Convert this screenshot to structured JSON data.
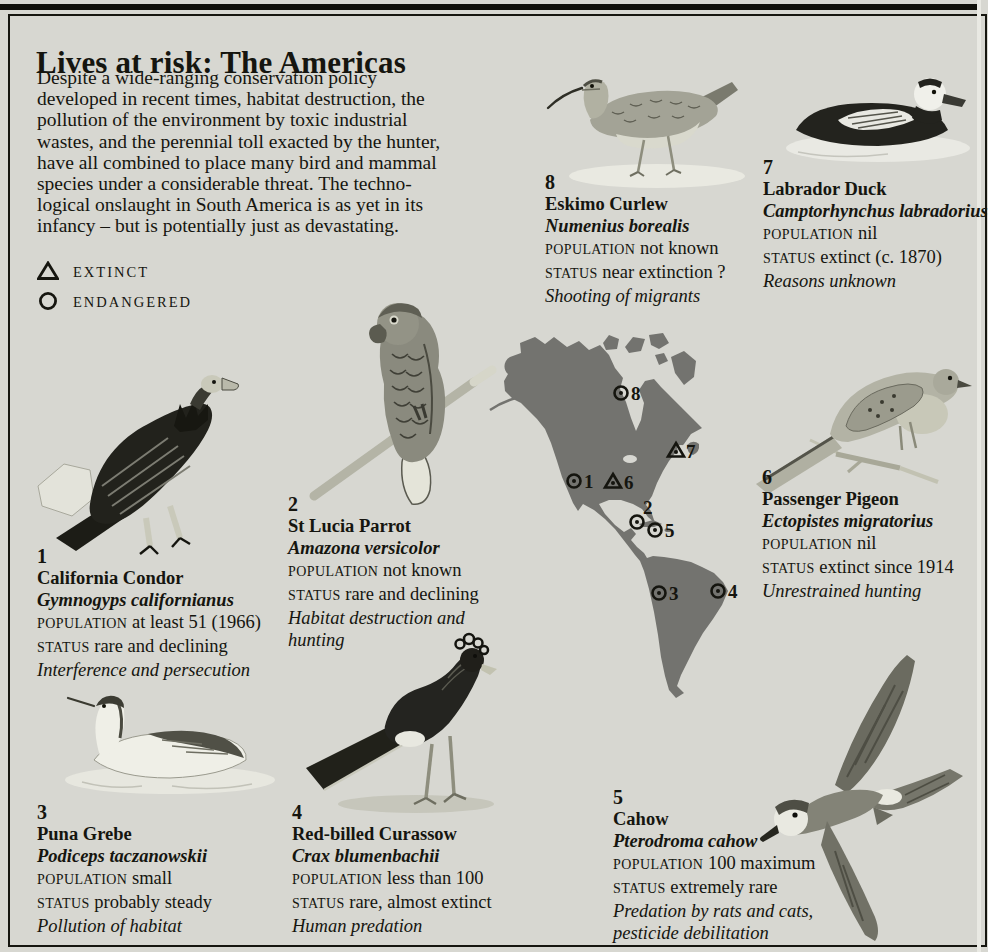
{
  "page": {
    "title": "Lives at risk: The Americas",
    "intro": "Despite a wide-ranging conservation policy\ndeveloped in recent times, habitat destruction, the\npollution of the environment by toxic industrial\nwastes, and the perennial toll exacted by the hunter,\nhave all combined to place many bird and mammal\nspecies under a considerable threat. The techno-\nlogical onslaught in South America is as yet in its\ninfancy – but is potentially just as devastating."
  },
  "legend": {
    "extinct": "EXTINCT",
    "endangered": "ENDANGERED"
  },
  "labels": {
    "population": "POPULATION",
    "status": "STATUS"
  },
  "species": [
    {
      "number": "1",
      "name": "California Condor",
      "latin": "Gymnogyps californianus",
      "population": "at least 51 (1966)",
      "status": "rare and declining",
      "reason": "Interference and persecution"
    },
    {
      "number": "2",
      "name": "St Lucia Parrot",
      "latin": "Amazona versicolor",
      "population": "not known",
      "status": "rare and declining",
      "reason": "Habitat destruction and hunting"
    },
    {
      "number": "3",
      "name": "Puna Grebe",
      "latin": "Podiceps taczanowskii",
      "population": "small",
      "status": "probably steady",
      "reason": "Pollution of habitat"
    },
    {
      "number": "4",
      "name": "Red-billed Curassow",
      "latin": "Crax blumenbachii",
      "population": "less than 100",
      "status": "rare, almost extinct",
      "reason": "Human predation"
    },
    {
      "number": "5",
      "name": "Cahow",
      "latin": "Pterodroma cahow",
      "population": "100 maximum",
      "status": "extremely rare",
      "reason": "Predation by rats and cats, pesticide debilitation"
    },
    {
      "number": "6",
      "name": "Passenger Pigeon",
      "latin": "Ectopistes migratorius",
      "population": "nil",
      "status": "extinct since 1914",
      "reason": "Unrestrained hunting"
    },
    {
      "number": "7",
      "name": "Labrador Duck",
      "latin": "Camptorhynchus labradorius",
      "population": "nil",
      "status": "extinct (c. 1870)",
      "reason": "Reasons unknown"
    },
    {
      "number": "8",
      "name": "Eskimo Curlew",
      "latin": "Numenius borealis",
      "population": "not known",
      "status": "near extinction ?",
      "reason": "Shooting of migrants"
    }
  ],
  "map": {
    "markers": [
      {
        "label": "8",
        "type": "endangered",
        "x": 133,
        "y": 65,
        "lx": 143,
        "ly": 72
      },
      {
        "label": "7",
        "type": "extinct",
        "x": 188,
        "y": 123,
        "lx": 198,
        "ly": 130
      },
      {
        "label": "1",
        "type": "endangered",
        "x": 86,
        "y": 153,
        "lx": 96,
        "ly": 160
      },
      {
        "label": "6",
        "type": "extinct",
        "x": 125,
        "y": 154,
        "lx": 136,
        "ly": 161
      },
      {
        "label": "2",
        "type": "endangered",
        "x": 149,
        "y": 194,
        "lx": 155,
        "ly": 186
      },
      {
        "label": "5",
        "type": "endangered",
        "x": 167,
        "y": 202,
        "lx": 177,
        "ly": 209
      },
      {
        "label": "3",
        "type": "endangered",
        "x": 171,
        "y": 265,
        "lx": 181,
        "ly": 272
      },
      {
        "label": "4",
        "type": "endangered",
        "x": 230,
        "y": 263,
        "lx": 240,
        "ly": 270
      }
    ]
  },
  "colors": {
    "paper": "#d7d7d1",
    "ink": "#15150f",
    "map_gray": "#73736f"
  }
}
